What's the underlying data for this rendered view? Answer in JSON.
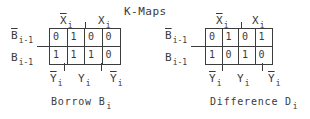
{
  "title": "K-Maps",
  "maps": [
    {
      "name": "borrow",
      "caption": "Borrow B",
      "caption_sub": "i",
      "col_group_labels": [
        {
          "text": "X",
          "sub": "i",
          "bar": true
        },
        {
          "text": "X",
          "sub": "i",
          "bar": false
        }
      ],
      "row_labels": [
        {
          "text": "B",
          "sub": "i-1",
          "bar": true
        },
        {
          "text": "B",
          "sub": "i-1",
          "bar": false
        }
      ],
      "bottom_labels": [
        {
          "text": "Y",
          "sub": "i",
          "bar": true
        },
        {
          "text": "Y",
          "sub": "i",
          "bar": false
        },
        {
          "text": "Y",
          "sub": "i",
          "bar": true
        }
      ],
      "cells": [
        [
          "0",
          "1",
          "0",
          "0"
        ],
        [
          "1",
          "1",
          "1",
          "0"
        ]
      ]
    },
    {
      "name": "difference",
      "caption": "Difference D",
      "caption_sub": "i",
      "col_group_labels": [
        {
          "text": "X",
          "sub": "i",
          "bar": true
        },
        {
          "text": "X",
          "sub": "i",
          "bar": false
        }
      ],
      "row_labels": [
        {
          "text": "B",
          "sub": "i-1",
          "bar": true
        },
        {
          "text": "B",
          "sub": "i-1",
          "bar": false
        }
      ],
      "bottom_labels": [
        {
          "text": "Y",
          "sub": "i",
          "bar": true
        },
        {
          "text": "Y",
          "sub": "i",
          "bar": false
        },
        {
          "text": "Y",
          "sub": "i",
          "bar": true
        }
      ],
      "cells": [
        [
          "0",
          "1",
          "0",
          "1"
        ],
        [
          "1",
          "0",
          "1",
          "0"
        ]
      ]
    }
  ]
}
